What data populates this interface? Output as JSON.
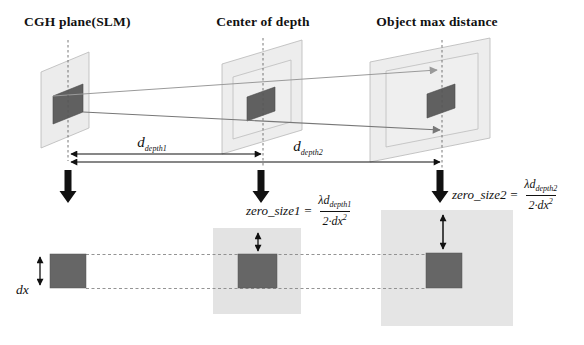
{
  "figure": {
    "plane_labels": [
      {
        "label": "CGH plane(SLM)"
      },
      {
        "label": "Center of depth"
      },
      {
        "label": "Object max distance"
      }
    ],
    "distance1": {
      "base": "d",
      "sub": "depth1"
    },
    "distance2": {
      "base": "d",
      "sub": "depth2"
    },
    "formula1": {
      "lhs": "zero_size1",
      "equals": "=",
      "num_base": "λd",
      "num_sub": "depth1",
      "den_base": "2·dx",
      "den_exp": "2"
    },
    "formula2": {
      "lhs": "zero_size2",
      "equals": "=",
      "num_base": "λd",
      "num_sub": "depth2",
      "den_base": "2·dx",
      "den_exp": "2"
    },
    "pixel_size_label": "dx",
    "colors": {
      "panel_light": "#e3e3e3",
      "plane_translucent": "#dcdcdc",
      "square_dark": "#656565",
      "arrow_black": "#111111",
      "ray_gray": "#9a9a9a"
    }
  }
}
